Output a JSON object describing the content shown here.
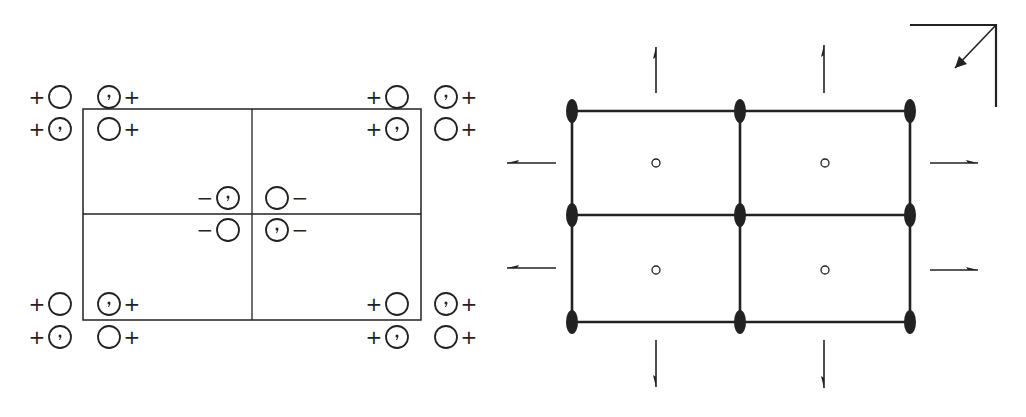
{
  "figure": {
    "colors": {
      "ink": "#222222",
      "background": "#ffffff"
    }
  },
  "left_panel": {
    "name": "general-positions",
    "cell": {
      "x0": 83,
      "y0": 109,
      "x1": 421,
      "y1": 320,
      "mid_x": 252,
      "mid_y": 214
    },
    "circle_radius": 11,
    "positions": [
      {
        "cx": 60,
        "cy": 97,
        "comma": false,
        "sign": "+",
        "sign_side": "left"
      },
      {
        "cx": 109,
        "cy": 97,
        "comma": true,
        "sign": "+",
        "sign_side": "right"
      },
      {
        "cx": 60,
        "cy": 129,
        "comma": true,
        "sign": "+",
        "sign_side": "left"
      },
      {
        "cx": 109,
        "cy": 129,
        "comma": false,
        "sign": "+",
        "sign_side": "right"
      },
      {
        "cx": 397,
        "cy": 97,
        "comma": false,
        "sign": "+",
        "sign_side": "left"
      },
      {
        "cx": 446,
        "cy": 97,
        "comma": true,
        "sign": "+",
        "sign_side": "right"
      },
      {
        "cx": 397,
        "cy": 129,
        "comma": true,
        "sign": "+",
        "sign_side": "left"
      },
      {
        "cx": 446,
        "cy": 129,
        "comma": false,
        "sign": "+",
        "sign_side": "right"
      },
      {
        "cx": 228,
        "cy": 198,
        "comma": true,
        "sign": "−",
        "sign_side": "left"
      },
      {
        "cx": 277,
        "cy": 198,
        "comma": false,
        "sign": "−",
        "sign_side": "right"
      },
      {
        "cx": 228,
        "cy": 230,
        "comma": false,
        "sign": "−",
        "sign_side": "left"
      },
      {
        "cx": 277,
        "cy": 230,
        "comma": true,
        "sign": "−",
        "sign_side": "right"
      },
      {
        "cx": 60,
        "cy": 304,
        "comma": false,
        "sign": "+",
        "sign_side": "left"
      },
      {
        "cx": 109,
        "cy": 304,
        "comma": true,
        "sign": "+",
        "sign_side": "right"
      },
      {
        "cx": 60,
        "cy": 337,
        "comma": true,
        "sign": "+",
        "sign_side": "left"
      },
      {
        "cx": 109,
        "cy": 337,
        "comma": false,
        "sign": "+",
        "sign_side": "right"
      },
      {
        "cx": 397,
        "cy": 304,
        "comma": false,
        "sign": "+",
        "sign_side": "left"
      },
      {
        "cx": 446,
        "cy": 304,
        "comma": true,
        "sign": "+",
        "sign_side": "right"
      },
      {
        "cx": 397,
        "cy": 337,
        "comma": true,
        "sign": "+",
        "sign_side": "left"
      },
      {
        "cx": 446,
        "cy": 337,
        "comma": false,
        "sign": "+",
        "sign_side": "right"
      }
    ]
  },
  "right_panel": {
    "name": "symmetry-elements",
    "grid": {
      "xs": [
        572,
        740,
        910
      ],
      "ys": [
        111,
        215,
        322
      ]
    },
    "twofold_axes": [
      {
        "x": 572,
        "y": 111
      },
      {
        "x": 740,
        "y": 111
      },
      {
        "x": 910,
        "y": 111
      },
      {
        "x": 572,
        "y": 215
      },
      {
        "x": 740,
        "y": 215
      },
      {
        "x": 910,
        "y": 215
      },
      {
        "x": 572,
        "y": 322
      },
      {
        "x": 740,
        "y": 322
      },
      {
        "x": 910,
        "y": 322
      }
    ],
    "inversion_centers": [
      {
        "x": 656,
        "y": 163
      },
      {
        "x": 825,
        "y": 163
      },
      {
        "x": 656,
        "y": 270
      },
      {
        "x": 825,
        "y": 270
      }
    ],
    "screw_axes_arrows": [
      {
        "dir": "up",
        "x": 656,
        "y0": 93,
        "y1": 47
      },
      {
        "dir": "up",
        "x": 824,
        "y0": 93,
        "y1": 45
      },
      {
        "dir": "down",
        "x": 656,
        "y0": 340,
        "y1": 387
      },
      {
        "dir": "down",
        "x": 824,
        "y0": 340,
        "y1": 388
      },
      {
        "dir": "left",
        "y": 163,
        "x0": 556,
        "x1": 507
      },
      {
        "dir": "left",
        "y": 268,
        "x0": 556,
        "x1": 507
      },
      {
        "dir": "right",
        "y": 163,
        "x0": 930,
        "x1": 978
      },
      {
        "dir": "right",
        "y": 270,
        "x0": 930,
        "x1": 978
      }
    ],
    "axes_marker": {
      "corner_x": 996,
      "corner_y": 25,
      "left_x": 910,
      "bottom_y": 107,
      "arrow_to_x": 955,
      "arrow_to_y": 68
    }
  }
}
